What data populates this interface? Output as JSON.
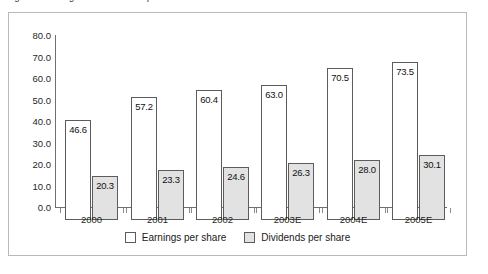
{
  "caption": {
    "text": "Figure: Earnings and dividends per share"
  },
  "legend": {
    "position": "bottom-center",
    "items": [
      {
        "label": "Earnings per share",
        "swatch": "white-square-icon",
        "color": "#ffffff"
      },
      {
        "label": "Dividends per share",
        "swatch": "gray-square-icon",
        "color": "#e2e2e2"
      }
    ]
  },
  "axis": {
    "y_ticks": [
      "80.0",
      "70.0",
      "60.0",
      "50.0",
      "40.0",
      "30.0",
      "20.0",
      "10.0",
      "0.0"
    ],
    "x_ticks": [
      "2000",
      "2001",
      "2002",
      "2003E",
      "2004E",
      "2005E"
    ]
  },
  "chart_data": {
    "type": "bar",
    "title": "",
    "xlabel": "",
    "ylabel": "",
    "ylim": [
      0,
      80
    ],
    "ytick_step": 10,
    "grid": false,
    "legend_position": "bottom-center",
    "categories": [
      "2000",
      "2001",
      "2002",
      "2003E",
      "2004E",
      "2005E"
    ],
    "series": [
      {
        "name": "Earnings per share",
        "color": "#ffffff",
        "values": [
          46.6,
          57.2,
          60.4,
          63.0,
          70.5,
          73.5
        ],
        "labels": [
          "46.6",
          "57.2",
          "60.4",
          "63.0",
          "70.5",
          "73.5"
        ]
      },
      {
        "name": "Dividends per share",
        "color": "#e2e2e2",
        "values": [
          20.3,
          23.3,
          24.6,
          26.3,
          28.0,
          30.1
        ],
        "labels": [
          "20.3",
          "23.3",
          "24.6",
          "26.3",
          "28.0",
          "30.1"
        ]
      }
    ]
  }
}
